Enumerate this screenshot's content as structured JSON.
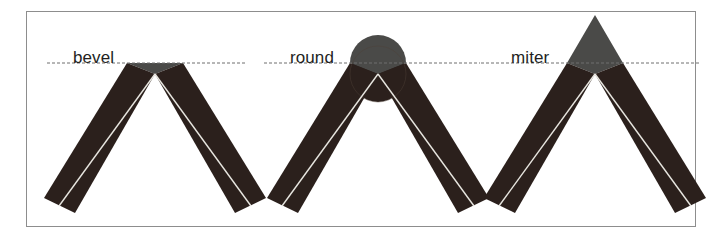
{
  "figure": {
    "background_color": "#ffffff",
    "frame_border_color": "#8d8d8d",
    "stroke_color": "#2b201c",
    "joint_cap_color": "#4a4a48",
    "centerline_color": "#e8e6e0",
    "guide_line_color": "#6f6f6f",
    "guide_line_style": "dashed",
    "panels": [
      {
        "id": "bevel",
        "label": "bevel",
        "label_x": 38,
        "label_y": 36,
        "guide_y": 51,
        "guide_x1": 12,
        "guide_x2": 212,
        "apex_x": 120,
        "apex_y": 62,
        "stroke_width": 31,
        "left_end_x": 24,
        "left_end_y": 201,
        "right_end_x": 216,
        "right_end_y": 201,
        "cap_shape": "triangle-flat-top",
        "cap_height": 11
      },
      {
        "id": "round",
        "label": "round",
        "label_x": 32,
        "label_y": 36,
        "guide_y": 51,
        "guide_x1": 6,
        "guide_x2": 222,
        "apex_x": 120,
        "apex_y": 62,
        "stroke_width": 31,
        "left_end_x": 24,
        "left_end_y": 201,
        "right_end_x": 216,
        "right_end_y": 201,
        "cap_shape": "semicircle",
        "cap_height": 26
      },
      {
        "id": "miter",
        "label": "miter",
        "label_x": 36,
        "label_y": 36,
        "guide_y": 51,
        "guide_x1": 6,
        "guide_x2": 226,
        "apex_x": 120,
        "apex_y": 62,
        "stroke_width": 31,
        "left_end_x": 24,
        "left_end_y": 201,
        "right_end_x": 216,
        "right_end_y": 201,
        "cap_shape": "sharp-point",
        "cap_height": 48
      }
    ]
  }
}
